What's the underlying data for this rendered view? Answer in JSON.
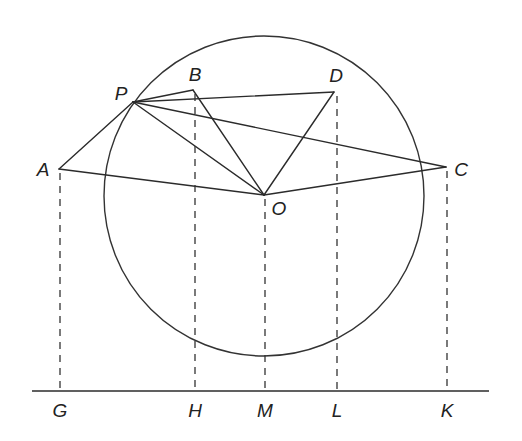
{
  "diagram": {
    "type": "geometry-construction",
    "circle": {
      "center": [
        264,
        196
      ],
      "radius": 160,
      "center_label": "O"
    },
    "points": {
      "P": {
        "x": 133,
        "y": 102,
        "label": "P",
        "label_pos": [
          121,
          93
        ]
      },
      "B": {
        "x": 193,
        "y": 90,
        "label": "B",
        "label_pos": [
          195,
          74
        ]
      },
      "D": {
        "x": 334,
        "y": 92,
        "label": "D",
        "label_pos": [
          336,
          75
        ]
      },
      "A": {
        "x": 59,
        "y": 169,
        "label": "A",
        "label_pos": [
          43,
          169
        ]
      },
      "O": {
        "x": 264,
        "y": 195,
        "label": "O",
        "label_pos": [
          279,
          208
        ]
      },
      "C": {
        "x": 446,
        "y": 167,
        "label": "C",
        "label_pos": [
          461,
          169
        ]
      }
    },
    "solid_segments": [
      [
        "A",
        "P"
      ],
      [
        "A",
        "O"
      ],
      [
        "P",
        "B"
      ],
      [
        "P",
        "D"
      ],
      [
        "P",
        "C"
      ],
      [
        "P",
        "O"
      ],
      [
        "B",
        "O"
      ],
      [
        "D",
        "O"
      ],
      [
        "O",
        "C"
      ]
    ],
    "baseline": {
      "y": 391,
      "x1": 32,
      "x2": 489
    },
    "feet": {
      "G": {
        "x": 60,
        "from": "A",
        "label": "G"
      },
      "H": {
        "x": 195,
        "from": "B",
        "label": "H"
      },
      "M": {
        "x": 265,
        "from": "O",
        "label": "M"
      },
      "L": {
        "x": 337,
        "from": "D",
        "label": "L"
      },
      "K": {
        "x": 447,
        "from": "C",
        "label": "K"
      }
    },
    "foot_label_y": 410,
    "colors": {
      "line": "#2b2b2b",
      "background": "#ffffff"
    }
  },
  "labels": {
    "P": "P",
    "B": "B",
    "D": "D",
    "A": "A",
    "O": "O",
    "C": "C",
    "G": "G",
    "H": "H",
    "M": "M",
    "L": "L",
    "K": "K"
  }
}
